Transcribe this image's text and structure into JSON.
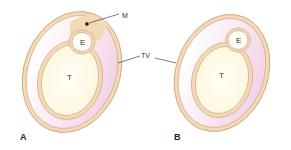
{
  "figure": {
    "panels": [
      {
        "id": "A",
        "label": "A",
        "labels": {
          "testis": "T",
          "epididymis": "E",
          "mesorchium": "M"
        }
      },
      {
        "id": "B",
        "label": "B",
        "labels": {
          "testis": "T",
          "epididymis": "E"
        }
      }
    ],
    "shared_label": "TV",
    "colors": {
      "layer": "#f3d9b5",
      "layer_stroke": "#c9a27a",
      "cavity": "#f6e1ee",
      "testis_fill": "#fffdf2",
      "line": "#444444"
    }
  }
}
